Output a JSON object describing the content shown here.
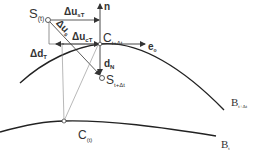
{
  "diagram": {
    "type": "geometric-vector-diagram",
    "labels": {
      "s_t": {
        "main": "S",
        "sub": "(t)"
      },
      "n": {
        "main": "n"
      },
      "du_sT_top": {
        "main": "Δu",
        "sub": "sT"
      },
      "du_s": {
        "main": "Δu",
        "sub": "s"
      },
      "du_cT": {
        "main": "Δu",
        "sub": "cT"
      },
      "c_tdt": {
        "main": "C",
        "sub": "t+Δt"
      },
      "e_o": {
        "main": "e",
        "sub": "o"
      },
      "dd_T": {
        "main": "Δd",
        "sub": "T"
      },
      "d_N": {
        "main": "d",
        "sub": "N"
      },
      "s_tdt": {
        "main": "S",
        "sub": "t+Δt"
      },
      "c_t": {
        "main": "C",
        "sub": "(t)"
      },
      "b_tdt": {
        "main": "B",
        "sub": "t+Δt"
      },
      "b_t": {
        "main": "B",
        "sub": "t"
      }
    },
    "colors": {
      "line": "#333333",
      "thin_line": "#777777",
      "text": "#333333",
      "background": "#ffffff"
    }
  }
}
